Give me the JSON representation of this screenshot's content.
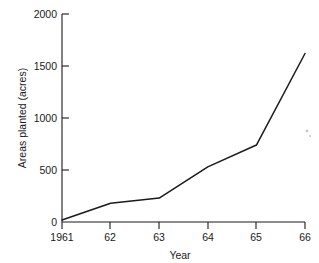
{
  "chart_data": {
    "type": "line",
    "title": "",
    "xlabel": "Year",
    "ylabel": "Areas planted (acres)",
    "x": [
      1961,
      1962,
      1963,
      1964,
      1965,
      1966
    ],
    "xtick_labels": [
      "1961",
      "62",
      "63",
      "64",
      "65",
      "66"
    ],
    "values": [
      20,
      180,
      230,
      530,
      740,
      1620
    ],
    "ytick_labels": [
      "0",
      "500",
      "1000",
      "1500",
      "2000"
    ],
    "ytick_values": [
      0,
      500,
      1000,
      1500,
      2000
    ],
    "ylim": [
      0,
      2000
    ],
    "xlim": [
      1961,
      1966
    ],
    "grid": false,
    "legend": null,
    "series": [
      {
        "name": "Areas planted",
        "values": [
          20,
          180,
          230,
          530,
          740,
          1620
        ]
      }
    ],
    "line_color": "#1a1a1a"
  },
  "axes": {
    "y_title": "Areas planted (acres)",
    "x_title": "Year"
  },
  "y_ticks": [
    {
      "label": "2000",
      "value": 2000
    },
    {
      "label": "1500",
      "value": 1500
    },
    {
      "label": "1000",
      "value": 1000
    },
    {
      "label": "500",
      "value": 500
    },
    {
      "label": "0",
      "value": 0
    }
  ],
  "x_ticks": [
    {
      "label": "1961",
      "value": 1961
    },
    {
      "label": "62",
      "value": 1962
    },
    {
      "label": "63",
      "value": 1963
    },
    {
      "label": "64",
      "value": 1964
    },
    {
      "label": "65",
      "value": 1965
    },
    {
      "label": "66",
      "value": 1966
    }
  ]
}
